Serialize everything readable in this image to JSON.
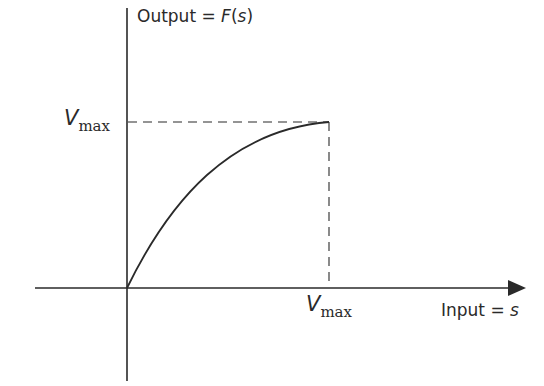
{
  "diagram": {
    "y_axis_label_prefix": "Output = ",
    "y_axis_label_func": "F",
    "y_axis_label_arg": "(s)",
    "x_axis_label_prefix": "Input = ",
    "x_axis_label_var": "s",
    "y_marker": {
      "symbol": "V",
      "subscript": "max"
    },
    "x_marker": {
      "symbol": "V",
      "subscript": "max"
    },
    "curve": "concave saturating curve from origin to (Vmax, Vmax)"
  },
  "colors": {
    "ink": "#2a2a2a",
    "background": "#ffffff"
  }
}
